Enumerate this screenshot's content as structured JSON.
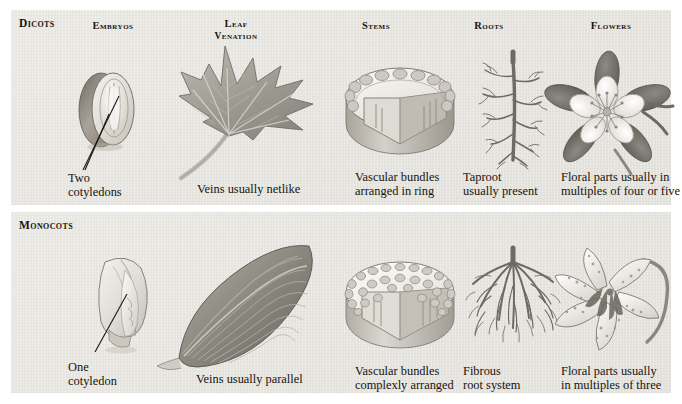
{
  "figure": {
    "background_color": "#ffffff",
    "panel_color": "#e9e7e2",
    "text_color": "#17140f"
  },
  "columns": [
    {
      "key": "embryos",
      "label": "Embryos"
    },
    {
      "key": "leaf",
      "label_line1": "Leaf",
      "label_line2": "Venation"
    },
    {
      "key": "stems",
      "label": "Stems"
    },
    {
      "key": "roots",
      "label": "Roots"
    },
    {
      "key": "flowers",
      "label": "Flowers"
    }
  ],
  "rows": [
    {
      "key": "dicots",
      "group_label": "Dicots",
      "cells": {
        "embryos": {
          "caption": "Two\ncotyledons",
          "art": "dicot-seed-two-cotyledons"
        },
        "leaf": {
          "caption": "Veins usually netlike",
          "art": "maple-leaf-netted-venation"
        },
        "stems": {
          "caption": "Vascular bundles\narranged in ring",
          "art": "stem-cross-section-ring"
        },
        "roots": {
          "caption": "Taproot\nusually present",
          "art": "taproot-system"
        },
        "flowers": {
          "caption": "Floral parts usually in\nmultiples of four or five",
          "art": "columbine-flower"
        }
      }
    },
    {
      "key": "monocots",
      "group_label": "Monocots",
      "cells": {
        "embryos": {
          "caption": "One\ncotyledon",
          "art": "monocot-seed-one-cotyledon"
        },
        "leaf": {
          "caption": "Veins usually parallel",
          "art": "lance-leaf-parallel-venation"
        },
        "stems": {
          "caption": "Vascular bundles\ncomplexly arranged",
          "art": "stem-cross-section-scattered"
        },
        "roots": {
          "caption": "Fibrous\nroot system",
          "art": "fibrous-root-system"
        },
        "flowers": {
          "caption": "Floral parts usually\nin multiples of three",
          "art": "trout-lily-flower"
        }
      }
    }
  ]
}
